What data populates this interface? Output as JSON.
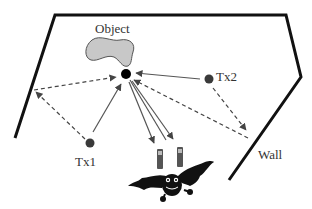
{
  "diagram": {
    "type": "echolocation-scene",
    "labels": {
      "object": "Object",
      "tx1": "Tx1",
      "tx2": "Tx2",
      "wall": "Wall"
    },
    "colors": {
      "wall": "#111111",
      "object_fill": "#c8c8c8",
      "object_stroke": "#555555",
      "dot": "#3a3a3a",
      "target_dot": "#000000",
      "arrow_solid": "#444444",
      "arrow_dashed": "#444444",
      "text": "#333333"
    },
    "nodes": [
      {
        "id": "object",
        "label": "Object",
        "x": 126,
        "y": 74,
        "shape": "blob"
      },
      {
        "id": "tx1",
        "label": "Tx1",
        "x": 90,
        "y": 143,
        "shape": "dot"
      },
      {
        "id": "tx2",
        "label": "Tx2",
        "x": 209,
        "y": 79,
        "shape": "dot"
      },
      {
        "id": "bat",
        "label": "",
        "x": 172,
        "y": 178,
        "shape": "bat-icon"
      },
      {
        "id": "wall",
        "label": "Wall",
        "shape": "polyline"
      }
    ],
    "edges": [
      {
        "from": "tx1",
        "to": "object",
        "style": "solid",
        "meaning": "direct signal"
      },
      {
        "from": "tx2",
        "to": "object",
        "style": "solid",
        "meaning": "direct signal"
      },
      {
        "from": "tx1",
        "to": "left-wall",
        "style": "dashed",
        "meaning": "multipath to wall"
      },
      {
        "from": "left-wall",
        "to": "object",
        "style": "dashed",
        "meaning": "wall reflection"
      },
      {
        "from": "tx2",
        "to": "right-wall",
        "style": "dashed",
        "meaning": "multipath to wall"
      },
      {
        "from": "right-wall",
        "to": "object",
        "style": "dashed",
        "meaning": "wall reflection"
      },
      {
        "from": "object",
        "to": "bat",
        "style": "solid",
        "count": 2,
        "meaning": "echoes to receiver"
      }
    ]
  }
}
